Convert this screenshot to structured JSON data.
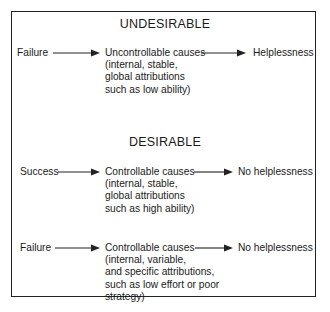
{
  "diagram": {
    "sections": [
      {
        "heading": "UNDESIRABLE",
        "flows": [
          {
            "outcome": "Failure",
            "cause": {
              "line1": "Uncontrollable causes",
              "line2": "(internal, stable,",
              "line3": "global attributions",
              "line4": "such as low ability)"
            },
            "result": "Helplessness"
          }
        ]
      },
      {
        "heading": "DESIRABLE",
        "flows": [
          {
            "outcome": "Success",
            "cause": {
              "line1": "Controllable causes",
              "line2": "(internal, stable,",
              "line3": "global attributions",
              "line4": "such as high ability)"
            },
            "result": "No helplessness"
          },
          {
            "outcome": "Failure",
            "cause": {
              "line1": "Controllable causes",
              "line2": "(internal, variable,",
              "line3": "and specific attributions,",
              "line4": "such as low effort or poor",
              "line5": "strategy)"
            },
            "result": "No helplessness"
          }
        ]
      }
    ],
    "colors": {
      "line": "#222222",
      "text": "#1a1a1a",
      "background": "#ffffff"
    }
  }
}
